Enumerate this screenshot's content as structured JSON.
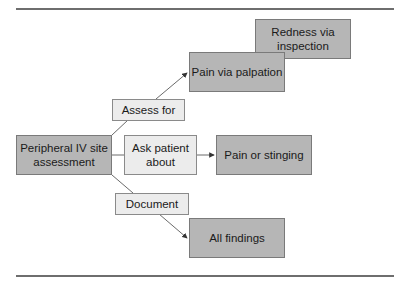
{
  "diagram": {
    "source": {
      "label": "Peripheral IV site assessment",
      "line1": "Peripheral IV site",
      "line2": "assessment"
    },
    "edges": [
      {
        "label": "Assess for",
        "targets": [
          "Pain via palpation",
          "Redness via inspection"
        ]
      },
      {
        "label": "Ask patient about",
        "line1": "Ask patient",
        "line2": "about",
        "targets": [
          "Pain or stinging"
        ]
      },
      {
        "label": "Document",
        "targets": [
          "All findings"
        ]
      }
    ],
    "nodes": {
      "redness": {
        "line1": "Redness via",
        "line2": "inspection"
      },
      "palpation": {
        "label": "Pain via palpation"
      },
      "stinging": {
        "label": "Pain or stinging"
      },
      "findings": {
        "label": "All findings"
      }
    },
    "colors": {
      "dark_box": "#b6b6b6",
      "light_box": "#ececec",
      "rule": "#6e6e6e"
    }
  }
}
